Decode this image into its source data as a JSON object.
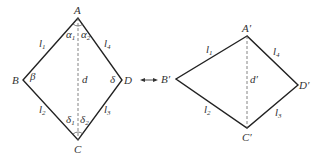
{
  "left_figure": {
    "vertices": {
      "A": "A",
      "B": "B",
      "C": "C",
      "D": "D"
    },
    "sides": {
      "l1": "l",
      "l1_sub": "1",
      "l2": "l",
      "l2_sub": "2",
      "l3": "l",
      "l3_sub": "3",
      "l4": "l",
      "l4_sub": "4"
    },
    "diagonal": "d",
    "angles": {
      "alpha1": "α",
      "alpha1_sub": "1",
      "alpha2": "α",
      "alpha2_sub": "2",
      "beta": "β",
      "delta": "δ",
      "delta1": "δ",
      "delta1_sub": "1",
      "delta2": "δ",
      "delta2_sub": "2"
    }
  },
  "right_figure": {
    "vertices": {
      "A": "A′",
      "B": "B′",
      "C": "C′",
      "D": "D′"
    },
    "sides": {
      "l1": "l",
      "l1_sub": "1",
      "l2": "l",
      "l2_sub": "2",
      "l3": "l",
      "l3_sub": "3",
      "l4": "l",
      "l4_sub": "4"
    },
    "diagonal": "d′"
  },
  "connector": {
    "symbol": "double-arrow"
  }
}
